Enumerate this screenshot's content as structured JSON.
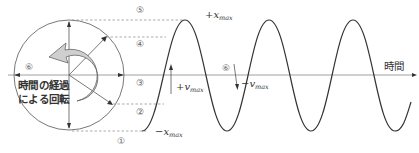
{
  "diagram": {
    "title_hidden": "Simple harmonic motion as projection of circular motion",
    "circle": {
      "rotation_label_line1": "時間の経過",
      "rotation_label_line2": "による回転"
    },
    "phase_markers": [
      "①",
      "②",
      "③",
      "④",
      "⑤",
      "⑥"
    ],
    "wave_marker": "⑥",
    "labels": {
      "x_max_pos_sign": "+",
      "x_max_neg_sign": "−",
      "v_max_pos_sign": "+",
      "v_max_neg_sign": "−",
      "x_var": "x",
      "v_var": "v",
      "max_sub": "max"
    },
    "time_axis_label": "時間",
    "colors": {
      "line": "#333333",
      "axis": "#777777",
      "dashed": "#888888",
      "arrow_fill": "#cfcfcf"
    }
  }
}
